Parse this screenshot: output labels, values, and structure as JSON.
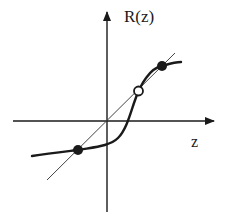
{
  "diagram": {
    "type": "function-plot",
    "axes": {
      "x_label": "z",
      "y_label": "R(z)"
    },
    "colors": {
      "axis": "#1a1a1a",
      "curve": "#1a1a1a",
      "diagonal": "#444444",
      "background": "#ffffff"
    },
    "elements": [
      {
        "name": "identity-line",
        "description": "thin diagonal line R(z)=z through origin"
      },
      {
        "name": "sigmoid-curve",
        "description": "thick S-shaped curve R(z)"
      },
      {
        "name": "fixed-point-lower",
        "style": "filled",
        "description": "stable fixed point (lower-left)"
      },
      {
        "name": "fixed-point-middle",
        "style": "open",
        "description": "unstable fixed point (middle)"
      },
      {
        "name": "fixed-point-upper",
        "style": "filled",
        "description": "stable fixed point (upper-right)"
      }
    ]
  }
}
